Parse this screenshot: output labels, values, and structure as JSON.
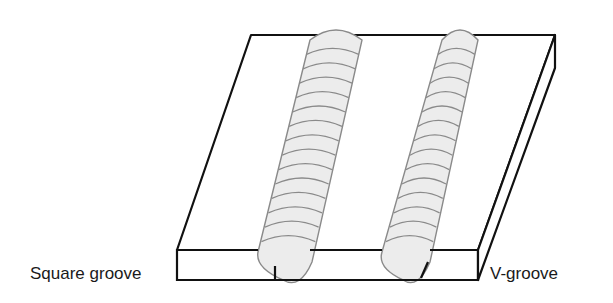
{
  "diagram": {
    "labels": {
      "left": "Square groove",
      "right": "V-groove"
    },
    "colors": {
      "outline": "#111111",
      "bead_fill": "#ececec",
      "bead_stroke": "#8a8a8a"
    },
    "beads": [
      {
        "name": "square-groove-weld",
        "ripples": 14
      },
      {
        "name": "v-groove-weld",
        "ripples": 14
      }
    ]
  }
}
